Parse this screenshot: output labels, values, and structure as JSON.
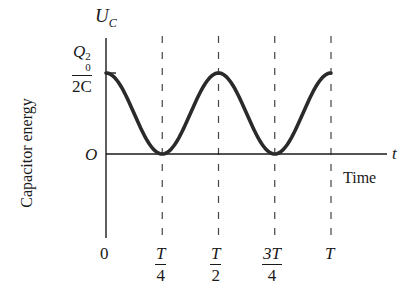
{
  "chart_data": {
    "type": "line",
    "title": "",
    "xlabel": "Time",
    "ylabel": "Capacitor energy",
    "x_axis_symbol": "t",
    "y_axis_symbol": "U_C",
    "y_axis_symbol_main": "U",
    "y_axis_symbol_sub": "C",
    "origin_label": "O",
    "y_max_label": {
      "numerator": "Q",
      "numerator_sub": "0",
      "numerator_sup": "2",
      "denominator": "2C"
    },
    "x_ticks": [
      {
        "value": 0,
        "label": "0"
      },
      {
        "value": 0.25,
        "label_num": "T",
        "label_den": "4"
      },
      {
        "value": 0.5,
        "label_num": "T",
        "label_den": "2"
      },
      {
        "value": 0.75,
        "label_num": "3T",
        "label_den": "4"
      },
      {
        "value": 1.0,
        "label": "T"
      }
    ],
    "series": [
      {
        "name": "U_C(t) = (Q0^2/2C) cos^2(2πt/T)",
        "x": [
          0,
          0.125,
          0.25,
          0.375,
          0.5,
          0.625,
          0.75,
          0.875,
          1.0
        ],
        "values": [
          1.0,
          0.5,
          0.0,
          0.5,
          1.0,
          0.5,
          0.0,
          0.5,
          1.0
        ]
      }
    ],
    "xlim": [
      0,
      1.0
    ],
    "ylim": [
      0,
      1.0
    ],
    "grid": false,
    "dashed_reference_lines_at": [
      0.25,
      0.5,
      0.75,
      1.0
    ],
    "legend": null
  },
  "layout": {
    "axis_x_px": 106,
    "axis_zero_y_px": 154,
    "peak_y_px": 73,
    "period_end_x_px": 331,
    "curve_color": "#2a2a2a",
    "axis_color": "#1a1a1a"
  }
}
